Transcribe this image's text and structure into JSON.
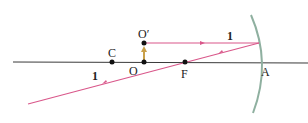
{
  "diagram": {
    "type": "optics-ray-diagram",
    "colors": {
      "axis": "#3a3a3a",
      "ray": "#d9578a",
      "mirror": "#8fb0a0",
      "object_arrow": "#c9a04a",
      "point": "#111111"
    },
    "points": {
      "C": {
        "label": "C"
      },
      "O": {
        "label": "O"
      },
      "O_prime": {
        "label": "O′"
      },
      "F": {
        "label": "F"
      },
      "A": {
        "label": "A"
      }
    },
    "rays": [
      {
        "label": "1",
        "segment": "incident"
      },
      {
        "label": "1",
        "segment": "reflected"
      }
    ]
  }
}
